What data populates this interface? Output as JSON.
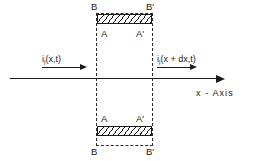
{
  "figure": {
    "axis": {
      "caption": "x - Axis",
      "direction_icon": "arrow-right-icon"
    },
    "currents": {
      "inflow": {
        "symbol": "i",
        "subscript": "i",
        "arguments": "(x,t)",
        "full": "i_i(x,t)",
        "arrow_icon": "arrow-right-icon"
      },
      "outflow": {
        "symbol": "i",
        "subscript": "i",
        "arguments": "(x + dx,t)",
        "full": "i_i(x + dx,t)",
        "arrow_icon": "arrow-right-icon"
      }
    },
    "nodes": {
      "top_left_outer": "B",
      "top_right_outer": "B'",
      "top_left_inner": "A",
      "top_right_inner": "A'",
      "bottom_left_inner": "A",
      "bottom_right_inner": "A'",
      "bottom_left_outer": "B",
      "bottom_right_outer": "B'"
    },
    "regions": {
      "control_volume_label": "dashed control volume",
      "hatched_top_label": "hatched conductor band (top)",
      "hatched_bottom_label": "hatched conductor band (bottom)"
    },
    "colors": {
      "ink": "#1a1a1a",
      "dash": "#2b2b2b",
      "background": "#ffffff"
    }
  }
}
